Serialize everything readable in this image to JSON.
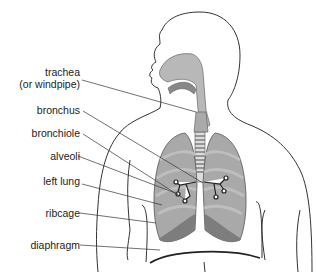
{
  "diagram": {
    "labels": [
      {
        "id": "trachea",
        "line1": "trachea",
        "line2": "(or windpipe)"
      },
      {
        "id": "bronchus",
        "line1": "bronchus"
      },
      {
        "id": "bronchiole",
        "line1": "bronchiole"
      },
      {
        "id": "alveoli",
        "line1": "alveoli"
      },
      {
        "id": "left-lung",
        "line1": "left lung"
      },
      {
        "id": "ribcage",
        "line1": "ribcage"
      },
      {
        "id": "diaphragm",
        "line1": "diaphragm"
      }
    ],
    "colors": {
      "outline": "#333333",
      "airway_fill": "#b8b8b8",
      "lung_fill": "#a9a9a9",
      "lung_dark": "#7d7d7d",
      "rib_light": "#c4c4c4"
    }
  }
}
